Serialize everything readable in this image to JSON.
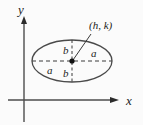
{
  "figure": {
    "type": "ellipse-diagram",
    "background_color": "#fbfbfb",
    "stroke_color": "#2b2b2b",
    "ellipse_color": "#4a4a4a",
    "dash_color": "#3a3a3a"
  },
  "axes": {
    "x_label": "x",
    "y_label": "y",
    "origin": {
      "x": 24,
      "y": 100
    },
    "x_axis": {
      "start_x": 8,
      "end_x": 118,
      "y": 100,
      "arrow": "right"
    },
    "y_axis": {
      "x": 24,
      "start_y": 18,
      "end_y": 122,
      "arrow": "up"
    }
  },
  "ellipse": {
    "center": {
      "x": 72,
      "y": 61
    },
    "semi_major_a": 40,
    "semi_minor_b": 21,
    "center_point_label": "(h, k)",
    "semi_major_label": "a",
    "semi_minor_label": "b"
  },
  "labels": {
    "center_callout": "(h, k)",
    "a_right": "a",
    "a_left": "a",
    "b_top": "b",
    "b_bottom": "b",
    "axis_x": "x",
    "axis_y": "y"
  }
}
